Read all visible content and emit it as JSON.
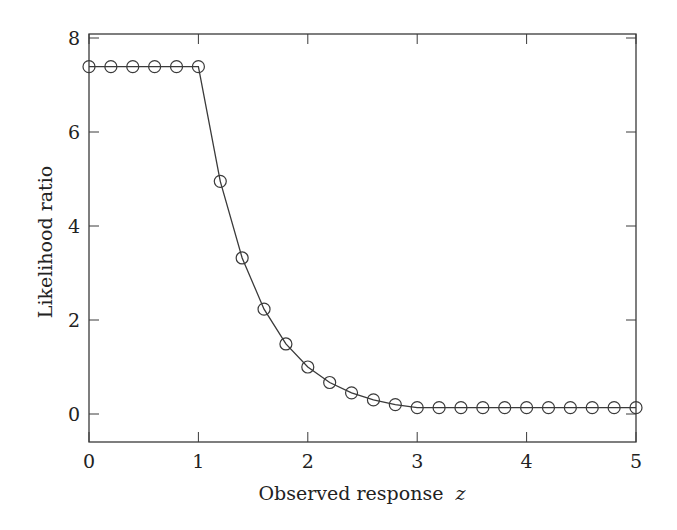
{
  "chart_data": {
    "type": "line",
    "title": "",
    "xlabel": "Observed response",
    "xlabel_var": "z",
    "ylabel": "Likelihood ratio",
    "xlim": [
      0,
      5
    ],
    "ylim": [
      -0.6,
      8.2
    ],
    "xticks": [
      0,
      1,
      2,
      3,
      4,
      5
    ],
    "yticks": [
      0,
      2,
      4,
      6,
      8
    ],
    "grid": false,
    "legend": null,
    "marker": "circle-open",
    "line_color": "#3a3a3a",
    "series": [
      {
        "name": "Likelihood ratio",
        "x": [
          0,
          0.2,
          0.4,
          0.6,
          0.8,
          1.0,
          1.2,
          1.4,
          1.6,
          1.8,
          2.0,
          2.2,
          2.4,
          2.6,
          2.8,
          3.0,
          3.2,
          3.4,
          3.6,
          3.8,
          4.0,
          4.2,
          4.4,
          4.6,
          4.8,
          5.0
        ],
        "y": [
          7.39,
          7.39,
          7.39,
          7.39,
          7.39,
          7.39,
          4.95,
          3.32,
          2.23,
          1.49,
          1.0,
          0.67,
          0.45,
          0.3,
          0.2,
          0.135,
          0.135,
          0.135,
          0.135,
          0.135,
          0.135,
          0.135,
          0.135,
          0.135,
          0.135,
          0.135
        ]
      }
    ]
  }
}
